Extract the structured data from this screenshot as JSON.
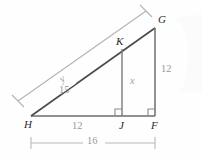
{
  "figure": {
    "background_color": "#fefefe",
    "stroke_dark": "#4a4a4a",
    "stroke_gray": "#9b9b9b",
    "text_dark": "#2b2b2b",
    "text_gray": "#9a9a9a",
    "vertices": [
      {
        "name": "H",
        "label": "H",
        "x": 31,
        "y": 116
      },
      {
        "name": "J",
        "label": "J",
        "x": 122,
        "y": 116
      },
      {
        "name": "F",
        "label": "F",
        "x": 155,
        "y": 116
      },
      {
        "name": "G",
        "label": "G",
        "x": 155,
        "y": 28
      },
      {
        "name": "K",
        "label": "K",
        "x": 122,
        "y": 49
      }
    ],
    "segment_labels": {
      "hypotenuse_known": "15",
      "hypotenuse_unknown": "y",
      "altitude_inner": "x",
      "altitude_outer": "12",
      "base_inner": "12",
      "base_outer": "16"
    },
    "vertex_labels": {
      "h": "H",
      "j": "J",
      "f": "F",
      "g": "G",
      "k": "K"
    },
    "right_angle_marks": 2
  }
}
